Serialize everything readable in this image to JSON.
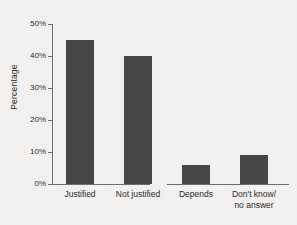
{
  "figure": {
    "background_color": "#f4f3f1",
    "bar_color": "#474747",
    "axis_color": "#6f6f6f"
  },
  "chart_data": {
    "type": "bar",
    "title": "",
    "xlabel": "",
    "ylabel": "Percentage",
    "categories": [
      "Justified",
      "Not justified",
      "Depends",
      "Don't know/ no answer"
    ],
    "category_lines": [
      [
        "Justified"
      ],
      [
        "Not justified"
      ],
      [
        "Depends"
      ],
      [
        "Don't know/",
        "no answer"
      ]
    ],
    "values": [
      45,
      40,
      6,
      9
    ],
    "ylim": [
      0,
      50
    ],
    "yticks": [
      0,
      10,
      20,
      30,
      40,
      50
    ],
    "ytick_labels": [
      "0%",
      "10%",
      "20%",
      "30%",
      "40%",
      "50%"
    ],
    "grid": false,
    "legend": null,
    "value_unit": "%"
  }
}
